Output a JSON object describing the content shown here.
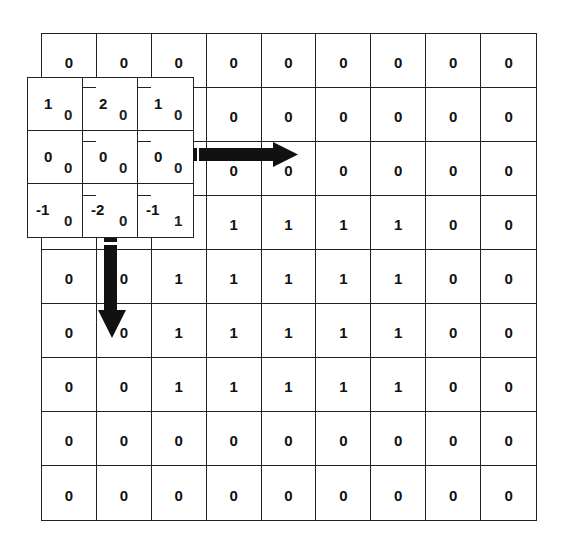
{
  "diagram": {
    "title": "",
    "image_grid": {
      "rows": 9,
      "cols": 9,
      "values": [
        [
          "0",
          "0",
          "0",
          "0",
          "0",
          "0",
          "0",
          "0",
          "0"
        ],
        [
          "0",
          "0",
          "0",
          "0",
          "0",
          "0",
          "0",
          "0",
          "0"
        ],
        [
          "0",
          "0",
          "0",
          "0",
          "0",
          "0",
          "0",
          "0",
          "0"
        ],
        [
          "0",
          "0",
          "1",
          "1",
          "1",
          "1",
          "1",
          "0",
          "0"
        ],
        [
          "0",
          "0",
          "1",
          "1",
          "1",
          "1",
          "1",
          "0",
          "0"
        ],
        [
          "0",
          "0",
          "1",
          "1",
          "1",
          "1",
          "1",
          "0",
          "0"
        ],
        [
          "0",
          "0",
          "1",
          "1",
          "1",
          "1",
          "1",
          "0",
          "0"
        ],
        [
          "0",
          "0",
          "0",
          "0",
          "0",
          "0",
          "0",
          "0",
          "0"
        ],
        [
          "0",
          "0",
          "0",
          "0",
          "0",
          "0",
          "0",
          "0",
          "0"
        ]
      ]
    },
    "kernel": {
      "position": {
        "row": 1,
        "col": 0
      },
      "weights": [
        [
          "1",
          "2",
          "1"
        ],
        [
          "0",
          "0",
          "0"
        ],
        [
          "-1",
          "-2",
          "-1"
        ]
      ],
      "underlying_values": [
        [
          "0",
          "0",
          "0"
        ],
        [
          "0",
          "0",
          "0"
        ],
        [
          "0",
          "0",
          "1"
        ]
      ]
    },
    "arrows": [
      {
        "name": "slide-right-arrow",
        "direction": "right",
        "color": "#111111"
      },
      {
        "name": "slide-down-arrow",
        "direction": "down",
        "color": "#111111"
      }
    ],
    "colors": {
      "line": "#222222",
      "text": "#111111",
      "background": "#ffffff"
    }
  }
}
